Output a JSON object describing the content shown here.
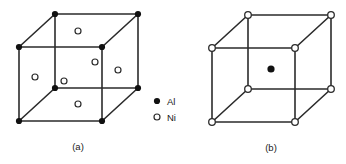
{
  "figure": {
    "type": "crystal-structure-diagram",
    "background": "#ffffff",
    "line_color": "#2b2b2b",
    "atom_fill_color": "#111111",
    "atom_open_fill": "#ffffff",
    "panels": [
      {
        "id": "a",
        "caption": "(a)",
        "description": "Cube with filled Al atoms at the eight corners and open Ni atoms at the six face centres",
        "corner_atom": "Al",
        "face_center_atom": "Ni"
      },
      {
        "id": "b",
        "caption": "(b)",
        "description": "Cube with open Ni atoms at the eight corners and one filled Al atom at the body centre",
        "corner_atom": "Ni",
        "body_center_atom": "Al"
      }
    ],
    "legend": {
      "items": [
        {
          "symbol": "filled-circle",
          "label": "Al"
        },
        {
          "symbol": "open-circle",
          "label": "Ni"
        }
      ]
    }
  }
}
